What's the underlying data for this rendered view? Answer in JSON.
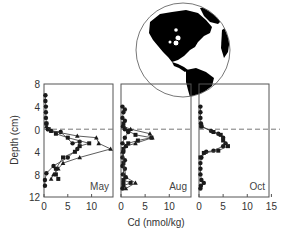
{
  "chart_data": {
    "type": "line",
    "title": "",
    "ylabel": "Depth (cm)",
    "xlabel": "Cd (nmol/kg)",
    "y_ticks": [
      "8",
      "4",
      "0",
      "4",
      "8",
      "12"
    ],
    "y_tick_values": [
      -8,
      -4,
      0,
      4,
      8,
      12
    ],
    "ylim": [
      -8,
      12
    ],
    "y_inverted": true,
    "reference_line": {
      "y": 0,
      "style": "dashed",
      "label": "sediment-water interface"
    },
    "inset": {
      "type": "globe",
      "description": "Western hemisphere globe with site marker near North American east coast"
    },
    "panels": [
      {
        "label": "May",
        "x_ticks": [
          "0",
          "5",
          "10"
        ],
        "xlim": [
          0,
          14.5
        ],
        "series": [
          {
            "name": "profile 1 (circles)",
            "marker": "circle",
            "points": [
              [
                0.3,
                -6
              ],
              [
                0.3,
                -5
              ],
              [
                0.4,
                -4
              ],
              [
                0.4,
                -3
              ],
              [
                0.4,
                -2
              ],
              [
                0.5,
                -1
              ],
              [
                0.8,
                0
              ],
              [
                1.5,
                0.3
              ],
              [
                3.5,
                0.5
              ],
              [
                6,
                2.5
              ],
              [
                7.5,
                2.2
              ],
              [
                7,
                3.5
              ],
              [
                5,
                5
              ],
              [
                2,
                6.5
              ],
              [
                0.5,
                7.8
              ],
              [
                0.2,
                9
              ],
              [
                0.2,
                10
              ]
            ]
          },
          {
            "name": "profile 2 (squares)",
            "marker": "square",
            "points": [
              [
                0.5,
                -1
              ],
              [
                1,
                0
              ],
              [
                2.5,
                0.8
              ],
              [
                5,
                1.5
              ],
              [
                9.5,
                2.5
              ],
              [
                7.5,
                3
              ],
              [
                6.5,
                4
              ],
              [
                4,
                5
              ],
              [
                2.5,
                7
              ],
              [
                2.5,
                8
              ],
              [
                3,
                8.8
              ]
            ]
          },
          {
            "name": "profile 3 (triangles)",
            "marker": "triangle",
            "points": [
              [
                0.5,
                -0.5
              ],
              [
                1.5,
                0.3
              ],
              [
                7,
                1.2
              ],
              [
                11,
                1.5
              ],
              [
                11.5,
                2.5
              ],
              [
                14,
                3.5
              ],
              [
                7.5,
                5
              ],
              [
                4,
                6
              ],
              [
                3,
                7
              ],
              [
                2,
                8
              ],
              [
                1.5,
                8.8
              ]
            ]
          }
        ]
      },
      {
        "label": "Aug",
        "x_ticks": [
          "0",
          "5",
          "10"
        ],
        "xlim": [
          0,
          14.5
        ],
        "series": [
          {
            "name": "profile 1 (circles)",
            "marker": "circle",
            "points": [
              [
                0.3,
                -4
              ],
              [
                0.8,
                -3.5
              ],
              [
                0.5,
                -3
              ],
              [
                0.3,
                -2
              ],
              [
                0.8,
                -1.5
              ],
              [
                0.4,
                -0.5
              ],
              [
                0.8,
                0
              ],
              [
                1.5,
                0.5
              ],
              [
                0.8,
                1.5
              ],
              [
                0.3,
                2.5
              ],
              [
                1,
                3
              ],
              [
                0.5,
                4
              ],
              [
                0.3,
                5
              ],
              [
                0.8,
                5.5
              ],
              [
                0.3,
                6.5
              ],
              [
                0.8,
                7
              ],
              [
                0.4,
                8
              ],
              [
                1,
                8.5
              ],
              [
                0.5,
                9.5
              ],
              [
                0.3,
                10.5
              ]
            ]
          },
          {
            "name": "profile 2 (squares)",
            "marker": "square",
            "points": [
              [
                0.5,
                -1
              ],
              [
                1.5,
                0.3
              ],
              [
                3,
                1
              ],
              [
                6.3,
                1.5
              ],
              [
                3.5,
                2
              ],
              [
                1.5,
                2.5
              ],
              [
                0.5,
                3.5
              ],
              [
                0.5,
                6
              ],
              [
                0.5,
                9
              ],
              [
                2,
                9.5
              ],
              [
                0.5,
                10
              ]
            ]
          },
          {
            "name": "profile 3 (triangles)",
            "marker": "triangle",
            "points": [
              [
                0.5,
                -0.5
              ],
              [
                2,
                0
              ],
              [
                6,
                0.8
              ],
              [
                6.5,
                1.5
              ],
              [
                3,
                2.5
              ],
              [
                1,
                3
              ],
              [
                0.3,
                4
              ],
              [
                1,
                8.5
              ],
              [
                3,
                9.5
              ],
              [
                1,
                10.5
              ]
            ]
          }
        ]
      },
      {
        "label": "Oct",
        "x_ticks": [
          "0",
          "5",
          "10",
          "15"
        ],
        "xlim": [
          0,
          14.5
        ],
        "series": [
          {
            "name": "profile 1 (circles)",
            "marker": "circle",
            "points": [
              [
                0.3,
                -4
              ],
              [
                0.3,
                -3
              ],
              [
                0.3,
                -2
              ],
              [
                0.4,
                -1
              ],
              [
                0.5,
                -0.5
              ],
              [
                2.5,
                0.3
              ],
              [
                4,
                0.8
              ],
              [
                5,
                1.5
              ],
              [
                5.5,
                2.5
              ],
              [
                5,
                3
              ],
              [
                3,
                3.8
              ],
              [
                1.5,
                4
              ],
              [
                0.5,
                5
              ],
              [
                0.3,
                6
              ],
              [
                0.3,
                7
              ],
              [
                0.3,
                8
              ],
              [
                0.5,
                9
              ],
              [
                1,
                9.5
              ],
              [
                0.4,
                10
              ],
              [
                0.3,
                10.5
              ]
            ]
          },
          {
            "name": "profile 2 (squares)",
            "marker": "square",
            "points": [
              [
                0.5,
                -0.5
              ],
              [
                3,
                0.5
              ],
              [
                4.5,
                1
              ],
              [
                5,
                2
              ],
              [
                6,
                3
              ],
              [
                4,
                3.8
              ],
              [
                1,
                4.2
              ],
              [
                0.3,
                5
              ]
            ]
          }
        ]
      }
    ]
  },
  "figure": {
    "ylabel": "Depth (cm)",
    "xlabel": "Cd (nmol/kg)",
    "y_tick_labels": [
      "8",
      "4",
      "0",
      "4",
      "8",
      "12"
    ],
    "panels": [
      {
        "label": "May",
        "x_tick_labels": [
          "0",
          "5",
          "10"
        ]
      },
      {
        "label": "Aug",
        "x_tick_labels": [
          "0",
          "5",
          "10"
        ]
      },
      {
        "label": "Oct",
        "x_tick_labels": [
          "0",
          "5",
          "10",
          "15"
        ]
      }
    ]
  },
  "colors": {
    "axis": "#555555",
    "data": "#1a1a1a",
    "dashed_line": "#777777",
    "globe_land": "#000000",
    "globe_ocean": "#ffffff"
  }
}
